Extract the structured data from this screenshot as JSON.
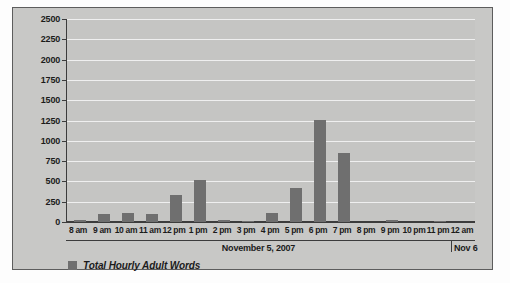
{
  "chart_data": {
    "type": "bar",
    "title": "",
    "xlabel": "November 5, 2007",
    "ylabel": "",
    "ylim": [
      0,
      2500
    ],
    "ytick_step": 250,
    "grid": true,
    "legend_position": "bottom-left",
    "bar_color": "#6f6f6f",
    "plot_background": "#c5c5c3",
    "gridline_color": "#efefef",
    "panel_background": "#c8c8c6",
    "axis_color": "#3c3c3c",
    "categories": [
      "8 am",
      "9 am",
      "10 am",
      "11 am",
      "12 pm",
      "1 pm",
      "2 pm",
      "3 pm",
      "4 pm",
      "5 pm",
      "6 pm",
      "7 pm",
      "8 pm",
      "9 pm",
      "10 pm",
      "11 pm",
      "12 am"
    ],
    "series": [
      {
        "name": "Total Hourly Adult Words",
        "values": [
          25,
          100,
          115,
          100,
          330,
          520,
          20,
          5,
          110,
          415,
          1260,
          850,
          0,
          20,
          0,
          15,
          0
        ]
      }
    ],
    "ytick_labels": [
      "2500",
      "2250",
      "2000",
      "1750",
      "1500",
      "1250",
      "1000",
      "750",
      "500",
      "250",
      "0"
    ],
    "ytick_values": [
      2500,
      2250,
      2000,
      1750,
      1500,
      1250,
      1000,
      750,
      500,
      250,
      0
    ],
    "date_band": {
      "main_label": "November 5, 2007",
      "next_label": "Nov 6"
    },
    "legend": [
      {
        "label": "Total Hourly Adult Words",
        "color": "#6f6f6f"
      }
    ]
  }
}
